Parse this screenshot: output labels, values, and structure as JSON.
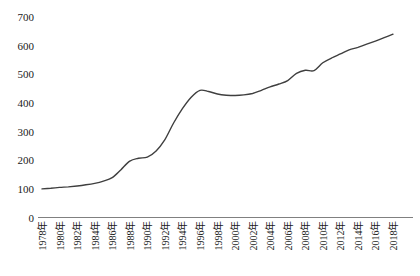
{
  "chart_data": {
    "type": "line",
    "title": "",
    "xlabel": "",
    "ylabel": "",
    "grid": false,
    "legend": false,
    "background": "#ffffff",
    "line_color": "#3f3f3f",
    "axis_color": "#808080",
    "ylim": [
      0,
      700
    ],
    "y_ticks": [
      0,
      100,
      200,
      300,
      400,
      500,
      600,
      700
    ],
    "x_tick_labels": [
      "1978年",
      "1980年",
      "1982年",
      "1984年",
      "1986年",
      "1988年",
      "1990年",
      "1992年",
      "1994年",
      "1996年",
      "1998年",
      "2000年",
      "2002年",
      "2004年",
      "2006年",
      "2008年",
      "2010年",
      "2012年",
      "2014年",
      "2016年",
      "2018年"
    ],
    "x": [
      1978,
      1979,
      1980,
      1981,
      1982,
      1983,
      1984,
      1985,
      1986,
      1987,
      1988,
      1989,
      1990,
      1991,
      1992,
      1993,
      1994,
      1995,
      1996,
      1997,
      1998,
      1999,
      2000,
      2001,
      2002,
      2003,
      2004,
      2005,
      2006,
      2007,
      2008,
      2009,
      2010,
      2011,
      2012,
      2013,
      2014,
      2015,
      2016,
      2017,
      2018
    ],
    "series": [
      {
        "name": "index-line",
        "values": [
          100,
          102,
          105,
          107,
          110,
          114,
          119,
          127,
          139,
          167,
          197,
          207,
          211,
          232,
          272,
          330,
          380,
          420,
          444,
          440,
          431,
          427,
          426,
          428,
          433,
          444,
          456,
          466,
          478,
          503,
          514,
          513,
          540,
          557,
          571,
          585,
          594,
          605,
          616,
          628,
          640
        ]
      }
    ]
  }
}
